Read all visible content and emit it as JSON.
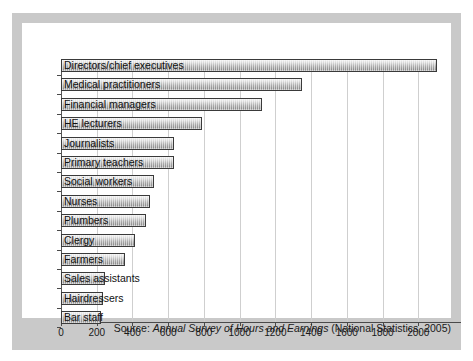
{
  "chart_data": {
    "type": "bar",
    "orientation": "horizontal",
    "title": "",
    "subtitle": "",
    "xlabel": "",
    "ylabel": "",
    "xlim": [
      0,
      2200
    ],
    "xticks": [
      0,
      200,
      400,
      600,
      800,
      1000,
      1200,
      1400,
      1600,
      1800,
      2000
    ],
    "xtick_labels": [
      "0",
      "200",
      "400",
      "600",
      "800",
      "1000",
      "1200",
      "1400",
      "1600",
      "1800",
      "2000"
    ],
    "grid": "vertical",
    "legend": "none",
    "categories": [
      "Directors/chief executives",
      "Medical practitioners",
      "Financial managers",
      "HE lecturers",
      "Journalists",
      "Primary teachers",
      "Social workers",
      "Nurses",
      "Plumbers",
      "Clergy",
      "Farmers",
      "Sales assistants",
      "Hairdressers",
      "Bar staff"
    ],
    "values": [
      2105,
      1350,
      1125,
      790,
      635,
      635,
      520,
      500,
      475,
      415,
      360,
      245,
      235,
      225
    ],
    "bar_fill": "#a9a9a9",
    "bar_edge": "#3a3a3a"
  },
  "caption": {
    "prefix": "Source: ",
    "italic_title": "Annual Survey of Hours and Earnings",
    "suffix": " (National Statistics, 2005)"
  },
  "colors": {
    "mount": "#c9c9c9",
    "panel": "#ffffff",
    "grid": "#cfcfcf",
    "axis": "#4a4a4a",
    "text": "#1a1a1a"
  }
}
